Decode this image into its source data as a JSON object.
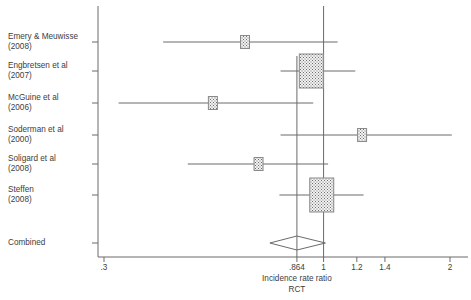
{
  "chart_data": {
    "type": "forest",
    "title": "",
    "xlabel": "Incidence rate ratio",
    "sublabel": "RCT",
    "ylabel": "",
    "scale": "log",
    "xlim": [
      0.3,
      2.0
    ],
    "xticks": [
      ".3",
      ".864",
      "1",
      "1.2",
      "1.4",
      "2"
    ],
    "xtick_values": [
      0.3,
      0.864,
      1,
      1.2,
      1.4,
      2
    ],
    "grid": false,
    "legend": "none",
    "null_line": 1,
    "pooled_line": 0.864,
    "studies": [
      {
        "label_line1": "Emery & Meuwisse",
        "label_line2": "(2008)",
        "estimate": 0.65,
        "ci_low": 0.415,
        "ci_high": 1.08,
        "marker_size": "small"
      },
      {
        "label_line1": "Engbretsen et al",
        "label_line2": "(2007)",
        "estimate": 0.935,
        "ci_low": 0.79,
        "ci_high": 1.19,
        "marker_size": "large"
      },
      {
        "label_line1": "McGuine et al",
        "label_line2": "(2006)",
        "estimate": 0.545,
        "ci_low": 0.325,
        "ci_high": 0.945,
        "marker_size": "small"
      },
      {
        "label_line1": "Soderman et al",
        "label_line2": "(2000)",
        "estimate": 1.235,
        "ci_low": 0.79,
        "ci_high": 2.02,
        "marker_size": "small"
      },
      {
        "label_line1": "Soligard et al",
        "label_line2": "(2008)",
        "estimate": 0.7,
        "ci_low": 0.475,
        "ci_high": 1.025,
        "marker_size": "small"
      },
      {
        "label_line1": "Steffen",
        "label_line2": "(2008)",
        "estimate": 0.99,
        "ci_low": 0.785,
        "ci_high": 1.245,
        "marker_size": "large"
      }
    ],
    "combined": {
      "label": "Combined",
      "estimate": 0.864,
      "ci_low": 0.745,
      "ci_high": 1.01
    }
  }
}
